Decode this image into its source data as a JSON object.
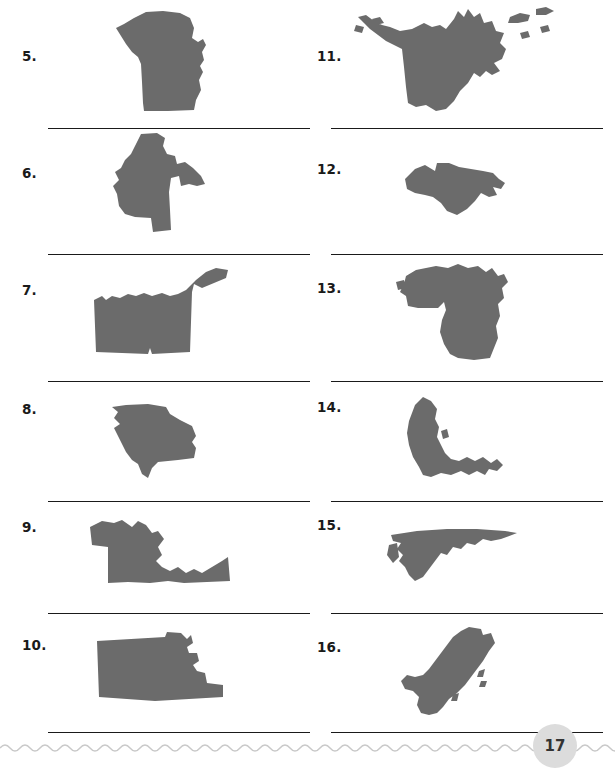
{
  "page": {
    "number": "17",
    "shape_fill_color": "#6b6b6b",
    "line_color": "#1a1a1a",
    "background_color": "#ffffff",
    "badge_color": "#dcdcdc"
  },
  "columns": [
    {
      "name": "left-column",
      "items": [
        {
          "number": "5.",
          "shape_name": "missouri-silhouette",
          "answer_line": ""
        },
        {
          "number": "6.",
          "shape_name": "minnesota-silhouette",
          "answer_line": ""
        },
        {
          "number": "7.",
          "shape_name": "oklahoma-silhouette",
          "answer_line": ""
        },
        {
          "number": "8.",
          "shape_name": "georgia-silhouette",
          "answer_line": ""
        },
        {
          "number": "9.",
          "shape_name": "maryland-silhouette",
          "answer_line": ""
        },
        {
          "number": "10.",
          "shape_name": "kansas-silhouette",
          "answer_line": ""
        }
      ]
    },
    {
      "name": "right-column",
      "items": [
        {
          "number": "11.",
          "shape_name": "alaska-silhouette",
          "answer_line": ""
        },
        {
          "number": "12.",
          "shape_name": "connecticut-silhouette",
          "answer_line": ""
        },
        {
          "number": "13.",
          "shape_name": "michigan-silhouette",
          "answer_line": ""
        },
        {
          "number": "14.",
          "shape_name": "florida-silhouette",
          "answer_line": ""
        },
        {
          "number": "15.",
          "shape_name": "virginia-silhouette",
          "answer_line": ""
        },
        {
          "number": "16.",
          "shape_name": "california-silhouette",
          "answer_line": ""
        }
      ]
    }
  ],
  "footer": {
    "wave_name": "wavy-divider",
    "page_number": "17"
  }
}
